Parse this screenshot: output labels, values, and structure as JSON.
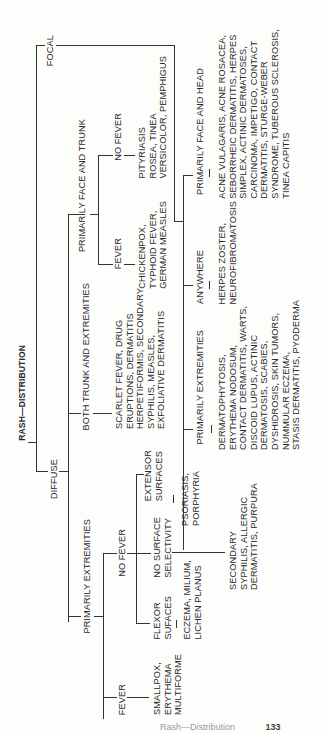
{
  "tree": {
    "root": "RASH—DISTRIBUTION",
    "focal": {
      "label": "FOCAL",
      "anywhere": {
        "label": "ANYWHERE",
        "conditions": [
          "HERPES ZOSTER,",
          "NEUROFIBROMATOSIS"
        ]
      },
      "primarily_extremities": {
        "label": "PRIMARILY EXTREMITIES",
        "conditions": [
          "DERMATOPHYTOSIS,",
          "ERYTHEMA NODOSUM,",
          "CONTACT DERMATITIS, WARTS,",
          "DISCOID LUPUS, ACTINIC",
          "DERMATOSIS, SCABIES,",
          "DYSHIDROSIS, SKIN TUMORS,",
          "NUMMULAR ECZEMA,",
          "STASIS DERMATITIS, PYODERMA"
        ]
      },
      "primarily_face_and_head": {
        "label": "PRIMARILY FACE AND HEAD",
        "conditions": [
          "ACNE VULAGARIS, ACNE ROSACEA,",
          "SEBORRHEIC DERMATITIS, HERPES",
          "SIMPLEX, ACTINIC DERMATOSES,",
          "CARCINOMA, IMPETIGO, CONTACT",
          "DERMATITIS, STURGE-WEBER",
          "SYNDROME, TUBEROUS SCLEROSIS,",
          "TINEA CAPITIS"
        ]
      }
    },
    "diffuse": {
      "label": "DIFFUSE",
      "primarily_face_and_trunk": {
        "label": "PRIMARILY FACE AND TRUNK",
        "fever": {
          "label": "FEVER",
          "conditions": [
            "CHICKENPOX,",
            "TYPHOID FEVER,",
            "GERMAN MEASLES"
          ]
        },
        "no_fever": {
          "label": "NO FEVER",
          "conditions": [
            "PITYRIASIS",
            "ROSEA, TINEA",
            "VERSICOLOR, PEMPHIGUS"
          ]
        }
      },
      "both_trunk_and_extremities": {
        "label": "BOTH TRUNK AND EXTREMITIES",
        "conditions": [
          "SCARLET FEVER, DRUG",
          "ERUPTIONS, DERMATITIS",
          "HERPETIFORMIS, SECONDARY",
          "SYPHILIS, MEASLES,",
          "EXFOLIATIVE DERMATITIS"
        ]
      },
      "primarily_extremities": {
        "label": "PRIMARILY EXTREMITIES",
        "fever": {
          "label": "FEVER",
          "conditions": [
            "SMALLPOX,",
            "ERYTHEMA",
            "MULTIFORME"
          ]
        },
        "no_fever": {
          "label": "NO FEVER",
          "extensor": {
            "label": [
              "EXTENSOR",
              "SURFACES"
            ],
            "conditions": [
              "PSORIASIS,",
              "PORPHYRIA"
            ]
          },
          "no_selectivity": {
            "label": [
              "NO SURFACE",
              "SELECTIVITY"
            ],
            "conditions": [
              "SECONDARY",
              "SYPHILIS, ALLERGIC",
              "DERMATITIS, PURPURA"
            ]
          },
          "flexor": {
            "label": [
              "FLEXOR",
              "SUFACES"
            ],
            "conditions": [
              "ECZEMA, MILIUM,",
              "LICHEN PLANUS"
            ]
          }
        }
      }
    }
  },
  "footer": {
    "running_title": "Rash—Distribution",
    "page_number": "133"
  }
}
